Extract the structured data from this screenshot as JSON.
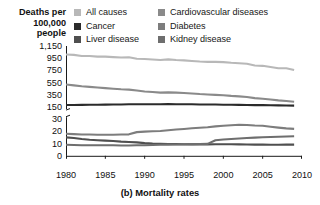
{
  "axis_title": {
    "line1": "Deaths per",
    "line2": "100,000",
    "line3": "people"
  },
  "caption": "(b) Mortality rates",
  "colors": {
    "all_causes": "#b8b8b8",
    "cardiovascular": "#8a8a8a",
    "cancer": "#2b2b2b",
    "diabetes": "#7d7d7d",
    "liver": "#4f4f4f",
    "kidney": "#6e6e6e",
    "axis": "#1a1a1a",
    "background": "#ffffff"
  },
  "legend": {
    "items": [
      {
        "label": "All causes",
        "color": "#b8b8b8",
        "key": "all_causes"
      },
      {
        "label": "Cardiovascular diseases",
        "color": "#8a8a8a",
        "key": "cardiovascular"
      },
      {
        "label": "Cancer",
        "color": "#2b2b2b",
        "key": "cancer"
      },
      {
        "label": "Diabetes",
        "color": "#7d7d7d",
        "key": "diabetes"
      },
      {
        "label": "Liver disease",
        "color": "#4f4f4f",
        "key": "liver"
      },
      {
        "label": "Kidney disease",
        "color": "#6e6e6e",
        "key": "kidney"
      }
    ]
  },
  "chart_data": {
    "type": "line",
    "title": "(b) Mortality rates",
    "xlabel": "",
    "ylabel": "Deaths per 100,000 people",
    "xlim": [
      1980,
      2010
    ],
    "x_ticks": [
      1980,
      1985,
      1990,
      1995,
      2000,
      2005,
      2010
    ],
    "y_ticks_upper": [
      150,
      350,
      550,
      750,
      950,
      1150
    ],
    "y_ticks_lower": [
      0,
      10,
      20,
      30
    ],
    "broken_axis": true,
    "axis_break_between": [
      30,
      150
    ],
    "grid": false,
    "legend_position": "top",
    "x": [
      1980,
      1981,
      1982,
      1983,
      1984,
      1985,
      1986,
      1987,
      1988,
      1989,
      1990,
      1991,
      1992,
      1993,
      1994,
      1995,
      1996,
      1997,
      1998,
      1999,
      2000,
      2001,
      2002,
      2003,
      2004,
      2005,
      2006,
      2007,
      2008,
      2009
    ],
    "series": [
      {
        "name": "All causes",
        "color": "#b8b8b8",
        "values": [
          1010,
          1005,
          985,
          985,
          975,
          975,
          968,
          962,
          965,
          940,
          938,
          928,
          920,
          930,
          920,
          915,
          905,
          895,
          890,
          890,
          885,
          875,
          868,
          858,
          830,
          825,
          805,
          785,
          785,
          755
        ]
      },
      {
        "name": "Cardiovascular diseases",
        "color": "#8a8a8a",
        "values": [
          520,
          505,
          490,
          480,
          470,
          460,
          450,
          440,
          435,
          420,
          405,
          395,
          385,
          390,
          385,
          380,
          372,
          362,
          355,
          348,
          342,
          332,
          325,
          315,
          295,
          285,
          272,
          258,
          248,
          235
        ]
      },
      {
        "name": "Cancer",
        "color": "#2b2b2b",
        "values": [
          183,
          184,
          185,
          187,
          188,
          189,
          190,
          192,
          194,
          194,
          195,
          196,
          196,
          197,
          196,
          196,
          194,
          192,
          191,
          190,
          188,
          186,
          185,
          184,
          181,
          180,
          178,
          176,
          175,
          173
        ]
      },
      {
        "name": "Diabetes",
        "color": "#7d7d7d",
        "values": [
          18.1,
          17.8,
          17.5,
          17.4,
          17.3,
          17.2,
          17.3,
          17.4,
          17.6,
          19.4,
          19.8,
          20.1,
          20.3,
          21.0,
          21.5,
          22.0,
          22.6,
          23.0,
          23.4,
          24.1,
          24.6,
          25.0,
          25.4,
          25.3,
          24.8,
          24.6,
          23.8,
          23.1,
          22.5,
          22.1
        ]
      },
      {
        "name": "Liver disease",
        "color": "#4f4f4f",
        "values": [
          15.1,
          14.6,
          13.8,
          13.2,
          12.8,
          12.4,
          12.1,
          11.6,
          11.3,
          11.0,
          10.4,
          10.0,
          9.8,
          9.7,
          9.6,
          9.5,
          9.4,
          9.4,
          9.4,
          9.5,
          9.5,
          9.5,
          9.4,
          9.3,
          9.2,
          9.2,
          9.1,
          9.1,
          9.2,
          9.2
        ]
      },
      {
        "name": "Kidney disease",
        "color": "#6e6e6e",
        "values": [
          9.1,
          8.9,
          8.7,
          8.6,
          8.6,
          8.6,
          8.6,
          8.5,
          8.5,
          8.6,
          8.7,
          8.8,
          9.0,
          9.2,
          9.3,
          9.4,
          9.6,
          9.7,
          9.8,
          12.8,
          13.3,
          13.8,
          14.2,
          14.6,
          14.9,
          15.2,
          15.4,
          15.6,
          15.8,
          16.0
        ]
      }
    ]
  }
}
